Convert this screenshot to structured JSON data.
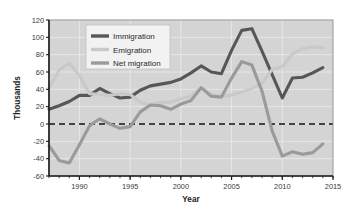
{
  "chart_data": {
    "type": "line",
    "title": "",
    "xlabel": "Year",
    "ylabel": "Thousands",
    "xlim": [
      1987,
      2015
    ],
    "ylim": [
      -60,
      120
    ],
    "grid": true,
    "legend_position": "top-left-inside",
    "y_ticks": [
      -60,
      -40,
      -20,
      0,
      20,
      40,
      60,
      80,
      100,
      120
    ],
    "y_tick_labels": [
      "-60",
      "-40",
      "-20",
      "0",
      "20",
      "40",
      "60",
      "80",
      "100",
      "120"
    ],
    "x_ticks": [
      1990,
      1995,
      2000,
      2005,
      2010,
      2015
    ],
    "x_tick_labels": [
      "1990",
      "1995",
      "2000",
      "2005",
      "2010",
      "2015"
    ],
    "x_minor_tick_step": 1,
    "zero_line": {
      "value": 0,
      "style": "dashed",
      "color": "#111111"
    },
    "x": [
      1987,
      1988,
      1989,
      1990,
      1991,
      1992,
      1993,
      1994,
      1995,
      1996,
      1997,
      1998,
      1999,
      2000,
      2001,
      2002,
      2003,
      2004,
      2005,
      2006,
      2007,
      2008,
      2009,
      2010,
      2011,
      2012,
      2013,
      2014
    ],
    "series": [
      {
        "name": "Immigration",
        "color": "#575757",
        "width": 3.1,
        "values": [
          17,
          21,
          26,
          33,
          33,
          41,
          35,
          30,
          31,
          39,
          44,
          46,
          48,
          52,
          59,
          67,
          60,
          58,
          85,
          108,
          110,
          84,
          57,
          30,
          53,
          54,
          59,
          65
        ]
      },
      {
        "name": "Emigration",
        "color": "#c9c9c9",
        "width": 3.1,
        "values": [
          42,
          62,
          70,
          56,
          35,
          34,
          33,
          35,
          34,
          25,
          22,
          25,
          25,
          29,
          32,
          42,
          34,
          32,
          33,
          37,
          41,
          47,
          63,
          66,
          81,
          87,
          89,
          88
        ]
      },
      {
        "name": "Net migration",
        "color": "#9a9a9a",
        "width": 3.1,
        "values": [
          -25,
          -42,
          -45,
          -24,
          -2,
          6,
          0,
          -5,
          -3,
          14,
          22,
          21,
          17,
          23,
          27,
          42,
          32,
          31,
          53,
          72,
          68,
          38,
          -8,
          -37,
          -32,
          -35,
          -33,
          -23
        ]
      }
    ],
    "plot_bg": "#d4d4d4",
    "grid_color": "#e9e9e9",
    "axis_color": "#1a1a1a"
  }
}
